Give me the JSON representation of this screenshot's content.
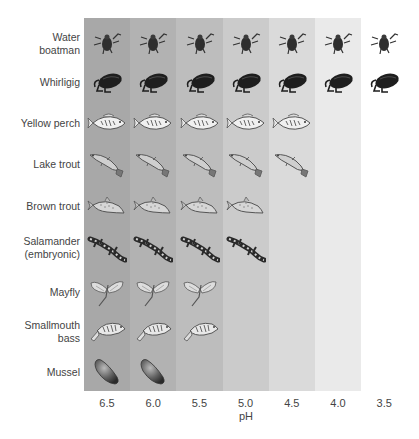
{
  "xlabel": "pH",
  "ph_values": [
    "6.5",
    "6.0",
    "5.5",
    "5.0",
    "4.5",
    "4.0",
    "3.5"
  ],
  "column_shades": [
    "#a8a8a8",
    "#b2b2b2",
    "#bdbdbd",
    "#cbcbcb",
    "#dadada",
    "#eaeaea",
    "#ffffff"
  ],
  "organisms": [
    {
      "label": "Water\nboatman",
      "icon": "water-boatman-icon",
      "min_ph": "3.5",
      "count": 7
    },
    {
      "label": "Whirligig",
      "icon": "whirligig-icon",
      "min_ph": "3.5",
      "count": 7
    },
    {
      "label": "Yellow perch",
      "icon": "yellow-perch-icon",
      "min_ph": "4.5",
      "count": 5
    },
    {
      "label": "Lake trout",
      "icon": "lake-trout-icon",
      "min_ph": "4.5",
      "count": 5
    },
    {
      "label": "Brown trout",
      "icon": "brown-trout-icon",
      "min_ph": "5.0",
      "count": 4
    },
    {
      "label": "Salamander\n(embryonic)",
      "icon": "salamander-icon",
      "min_ph": "5.0",
      "count": 4
    },
    {
      "label": "Mayfly",
      "icon": "mayfly-icon",
      "min_ph": "5.5",
      "count": 3
    },
    {
      "label": "Smallmouth\nbass",
      "icon": "smallmouth-bass-icon",
      "min_ph": "5.5",
      "count": 3
    },
    {
      "label": "Mussel",
      "icon": "mussel-icon",
      "min_ph": "6.0",
      "count": 2
    }
  ]
}
